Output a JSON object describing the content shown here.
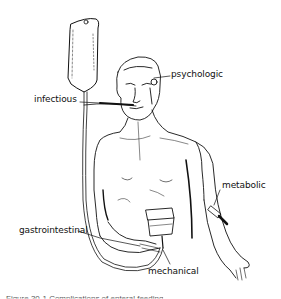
{
  "figure": {
    "labels": {
      "psychologic": "psychologic",
      "infectious": "infectious",
      "metabolic": "metabolic",
      "gastrointestinal": "gastrointestinal",
      "mechanical": "mechanical"
    },
    "caption_partial": "Figure 30-1  Complications of enteral feeding"
  }
}
